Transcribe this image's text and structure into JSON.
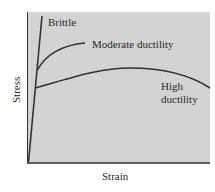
{
  "diagram": {
    "x_axis_label": "Strain",
    "y_axis_label": "Stress",
    "curves": [
      {
        "name": "brittle",
        "label": "Brittle"
      },
      {
        "name": "moderate",
        "label": "Moderate ductility"
      },
      {
        "name": "high",
        "label_line1": "High",
        "label_line2": "ductility"
      }
    ],
    "colors": {
      "plot_bg": "#d3d3d3",
      "line": "#333333",
      "text": "#2a2a2a"
    }
  }
}
